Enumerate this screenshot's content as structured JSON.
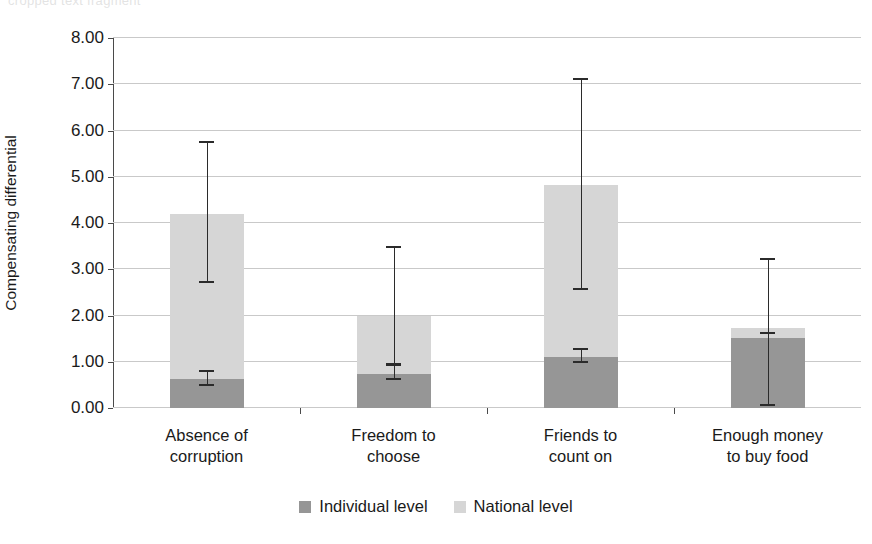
{
  "top_sliver_text": "cropped text fragment",
  "chart_data": {
    "type": "bar",
    "subtype": "stacked-bar-with-error-bars",
    "title": "",
    "xlabel": "",
    "ylabel": "Compensating differential",
    "ylim": [
      0,
      8
    ],
    "ytick_step": 1,
    "ytick_labels": [
      "0.00",
      "1.00",
      "2.00",
      "3.00",
      "4.00",
      "5.00",
      "6.00",
      "7.00",
      "8.00"
    ],
    "grid": true,
    "legend_position": "bottom-center",
    "categories": [
      "Absence of\ncorruption",
      "Freedom to\nchoose",
      "Friends to\ncount on",
      "Enough money\nto buy food"
    ],
    "category_lines": [
      [
        "Absence of",
        "corruption"
      ],
      [
        "Freedom to",
        "choose"
      ],
      [
        "Friends to",
        "count on"
      ],
      [
        "Enough money",
        "to buy food"
      ]
    ],
    "series": [
      {
        "name": "Individual level",
        "color": "#969696",
        "values": [
          0.62,
          0.73,
          1.1,
          1.52
        ],
        "error_low": [
          0.48,
          0.6,
          0.97,
          0.05
        ],
        "error_high": [
          0.78,
          0.92,
          1.25,
          1.6
        ]
      },
      {
        "name": "National level",
        "color": "#d6d6d6",
        "values": [
          3.58,
          1.27,
          3.73,
          0.21
        ]
      }
    ],
    "totals": [
      4.2,
      2.0,
      4.83,
      1.73
    ],
    "total_error_low": [
      2.7,
      0.9,
      2.55,
      0.05
    ],
    "total_error_high": [
      5.73,
      3.45,
      7.09,
      3.2
    ],
    "colors": {
      "individual": "#969696",
      "national": "#d6d6d6",
      "axis": "#4a4a4a",
      "grid": "#c9c9c9",
      "errorbar": "#2b2b2b"
    }
  },
  "legend": {
    "items": [
      {
        "label": "Individual level",
        "color": "#969696"
      },
      {
        "label": "National level",
        "color": "#d6d6d6"
      }
    ]
  }
}
